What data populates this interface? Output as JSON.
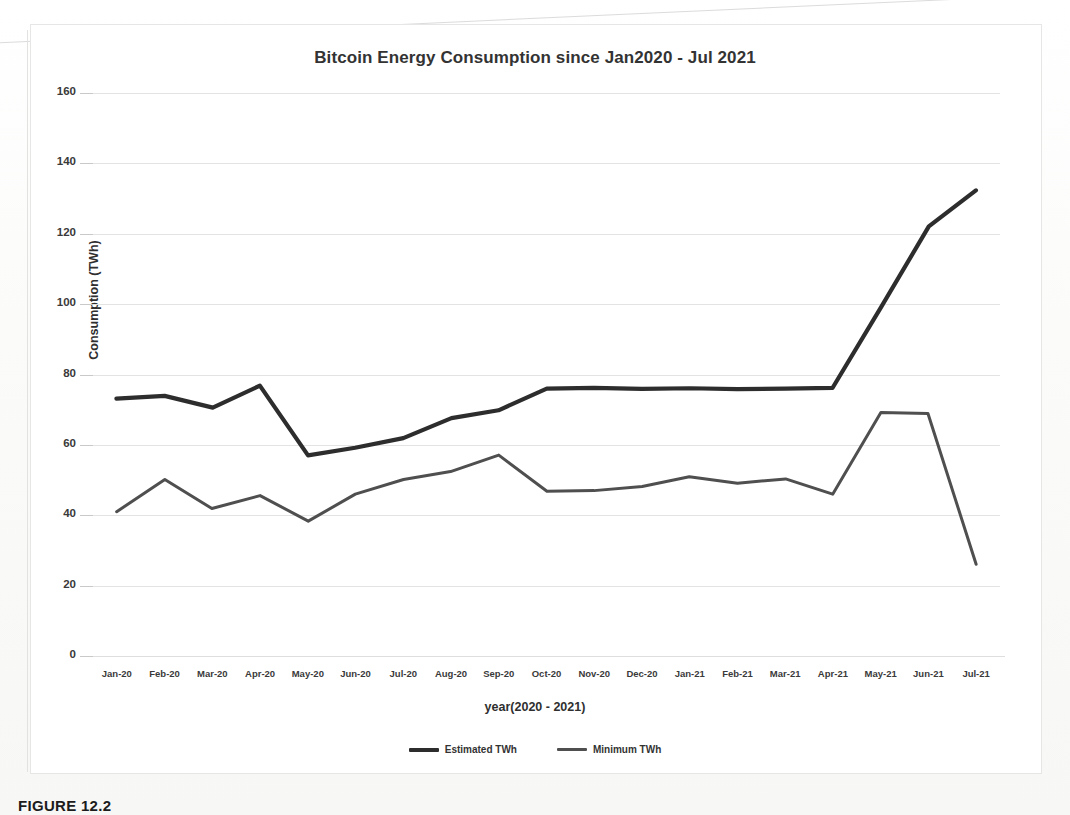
{
  "figure": {
    "caption": "FIGURE 12.2",
    "border_color": "#e6e6e4"
  },
  "chart_data": {
    "type": "line",
    "title": "Bitcoin Energy Consumption since Jan2020 - Jul 2021",
    "xlabel": "year(2020 - 2021)",
    "ylabel": "Consumption (TWh)",
    "ylim": [
      0,
      160
    ],
    "ytick_step": 20,
    "yticks": [
      "0",
      "20",
      "40",
      "60",
      "80",
      "100",
      "120",
      "140",
      "160"
    ],
    "grid": true,
    "legend_position": "bottom",
    "categories": [
      "Jan-20",
      "Feb-20",
      "Mar-20",
      "Apr-20",
      "May-20",
      "Jun-20",
      "Jul-20",
      "Aug-20",
      "Sep-20",
      "Oct-20",
      "Nov-20",
      "Dec-20",
      "Jan-21",
      "Feb-21",
      "Mar-21",
      "Apr-21",
      "May-21",
      "Jun-21",
      "Jul-21"
    ],
    "series": [
      {
        "name": "Estimated TWh",
        "color": "#2d2d2d",
        "width": 4.2,
        "values": [
          73,
          74,
          70.5,
          77,
          57,
          59,
          62,
          67.5,
          70,
          76,
          76,
          76,
          76,
          76,
          76,
          76,
          99,
          122,
          132.5
        ]
      },
      {
        "name": "Minimum TWh",
        "color": "#4f4f4f",
        "width": 3.0,
        "values": [
          41,
          50,
          42,
          45.5,
          38.5,
          46,
          50,
          52.5,
          57,
          47,
          47,
          48,
          51,
          49,
          50.5,
          46,
          69,
          69,
          26
        ]
      }
    ]
  },
  "axis_title_x": "year(2020 - 2021)",
  "axis_title_y": "Consumption (TWh)"
}
